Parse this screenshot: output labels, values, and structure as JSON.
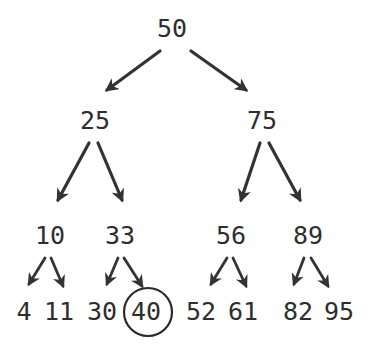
{
  "diagram": {
    "type": "binary-search-tree",
    "root": "50",
    "highlighted_node": "40",
    "colors": {
      "ink": "#2e2e2e",
      "background": "#ffffff"
    },
    "levels": [
      [
        "50"
      ],
      [
        "25",
        "75"
      ],
      [
        "10",
        "33",
        "56",
        "89"
      ],
      [
        "4",
        "11",
        "30",
        "40",
        "52",
        "61",
        "82",
        "95"
      ]
    ],
    "nodes": {
      "n50": "50",
      "n25": "25",
      "n75": "75",
      "n10": "10",
      "n33": "33",
      "n56": "56",
      "n89": "89",
      "n4": "4",
      "n11": "11",
      "n30": "30",
      "n40": "40",
      "n52": "52",
      "n61": "61",
      "n82": "82",
      "n95": "95"
    },
    "edges": [
      [
        "50",
        "25"
      ],
      [
        "50",
        "75"
      ],
      [
        "25",
        "10"
      ],
      [
        "25",
        "33"
      ],
      [
        "75",
        "56"
      ],
      [
        "75",
        "89"
      ],
      [
        "10",
        "4"
      ],
      [
        "10",
        "11"
      ],
      [
        "33",
        "30"
      ],
      [
        "33",
        "40"
      ],
      [
        "56",
        "52"
      ],
      [
        "56",
        "61"
      ],
      [
        "89",
        "82"
      ],
      [
        "89",
        "95"
      ]
    ]
  }
}
